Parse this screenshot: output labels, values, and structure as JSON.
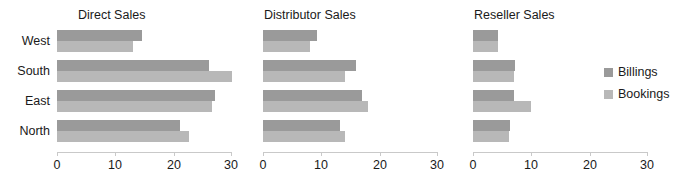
{
  "chart_data": {
    "type": "bar",
    "orientation": "horizontal",
    "title": "",
    "xlabel": "",
    "ylabel": "",
    "xlim": [
      0,
      30
    ],
    "xticks": [
      0,
      10,
      20,
      30
    ],
    "xtick_labels": [
      "0",
      "10",
      "20",
      "30"
    ],
    "grid": false,
    "categories": [
      "West",
      "South",
      "East",
      "North"
    ],
    "legend": {
      "position": "right",
      "entries": [
        {
          "name": "Billings",
          "color": "#9a9a9a"
        },
        {
          "name": "Bookings",
          "color": "#b8b8b8"
        }
      ]
    },
    "panels": [
      {
        "title": "Direct Sales",
        "series": [
          {
            "name": "Billings",
            "values": [
              14.6,
              26.0,
              27.1,
              21.1
            ]
          },
          {
            "name": "Bookings",
            "values": [
              13.0,
              30.0,
              26.6,
              22.6
            ]
          }
        ]
      },
      {
        "title": "Distributor Sales",
        "series": [
          {
            "name": "Billings",
            "values": [
              9.2,
              15.9,
              16.9,
              13.2
            ]
          },
          {
            "name": "Bookings",
            "values": [
              8.0,
              14.0,
              18.0,
              14.0
            ]
          }
        ]
      },
      {
        "title": "Reseller Sales",
        "series": [
          {
            "name": "Billings",
            "values": [
              4.2,
              7.2,
              7.1,
              6.3
            ]
          },
          {
            "name": "Bookings",
            "values": [
              4.2,
              7.0,
              10.0,
              6.2
            ]
          }
        ]
      }
    ]
  },
  "layout": {
    "panel_left": [
      57,
      263,
      473
    ],
    "panel_width": 175,
    "title_left": [
      78,
      264,
      474
    ],
    "row_tops": [
      0,
      30,
      60,
      90
    ],
    "colors": {
      "billings": "#9a9a9a",
      "bookings": "#b8b8b8",
      "axis": "#c9c9c9",
      "text": "#1a1a1a",
      "background": "#ffffff"
    }
  }
}
